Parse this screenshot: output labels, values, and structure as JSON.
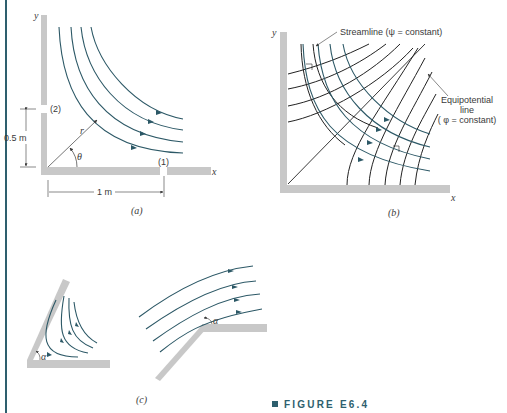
{
  "figure": {
    "caption": "FIGURE E6.4",
    "colors": {
      "accent": "#2e5f6e",
      "streamline": "#2c5866",
      "wall": "#c8c8c8",
      "text": "#3a3a3a"
    }
  },
  "panel_a": {
    "label": "(a)",
    "x_axis": "x",
    "y_axis": "y",
    "opening_1": "(1)",
    "opening_2": "(2)",
    "height_dim": "0.5 m",
    "width_dim": "1 m",
    "radius": "r",
    "angle": "θ"
  },
  "panel_b": {
    "label": "(b)",
    "x_axis": "x",
    "y_axis": "y",
    "streamline_label": "Streamline (ψ = constant)",
    "equipotential_line1": "Equipotential",
    "equipotential_line2": "line",
    "equipotential_line3": "( φ = constant)"
  },
  "panel_c": {
    "label": "(c)",
    "angle_left": "α",
    "angle_right": "α"
  }
}
